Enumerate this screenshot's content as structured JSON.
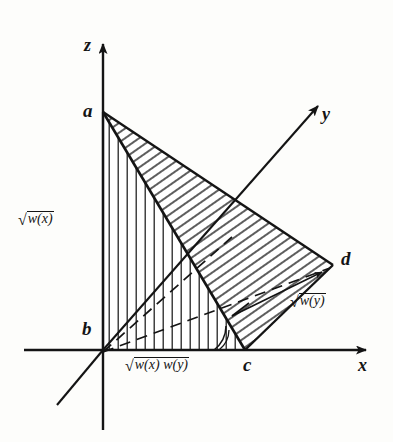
{
  "figure": {
    "background_color": "#fdfdfb",
    "ink_color": "#141414",
    "axes": {
      "z": {
        "label": "z",
        "name": "z-axis",
        "direction": "up"
      },
      "x": {
        "label": "x",
        "name": "x-axis",
        "direction": "right"
      },
      "y": {
        "label": "y",
        "name": "y-axis",
        "direction": "up-right-oblique"
      }
    },
    "vertices": [
      {
        "id": "a",
        "label": "a",
        "x": 103,
        "y": 112,
        "note": "apex on z-axis"
      },
      {
        "id": "b",
        "label": "b",
        "x": 103,
        "y": 350,
        "note": "origin"
      },
      {
        "id": "c",
        "label": "c",
        "x": 245,
        "y": 350,
        "note": "on x-axis"
      },
      {
        "id": "d",
        "label": "d",
        "x": 333,
        "y": 265,
        "note": "far right corner"
      }
    ],
    "measures": [
      {
        "id": "w-x",
        "radical": "√",
        "body": "w(x)",
        "position": "left of z-axis",
        "describes": "segment a-b"
      },
      {
        "id": "w-x-w-y",
        "radical": "√",
        "body": "w(x) w(y)",
        "position": "below x-axis",
        "describes": "segment b-c"
      },
      {
        "id": "w-y",
        "radical": "√",
        "body": "w(y)",
        "position": "right, below segment c-d",
        "describes": "segment c-d"
      }
    ],
    "regions": [
      {
        "id": "abc",
        "hatch": "vertical",
        "note": "triangle a-b-c, vertical hatch lines"
      },
      {
        "id": "acd",
        "hatch": "diagonal",
        "note": "triangle a-c-d, diagonal hatch lines"
      }
    ],
    "dashed_lines": [
      {
        "id": "b-to-mid-ac",
        "from": "b",
        "note": "dashed ray from origin into triangle"
      },
      {
        "id": "b-to-d",
        "from": "b",
        "to": "d",
        "note": "dashed line origin to d"
      }
    ],
    "angle_marker": {
      "at": "c",
      "note": "small arc marking angle at c"
    }
  }
}
